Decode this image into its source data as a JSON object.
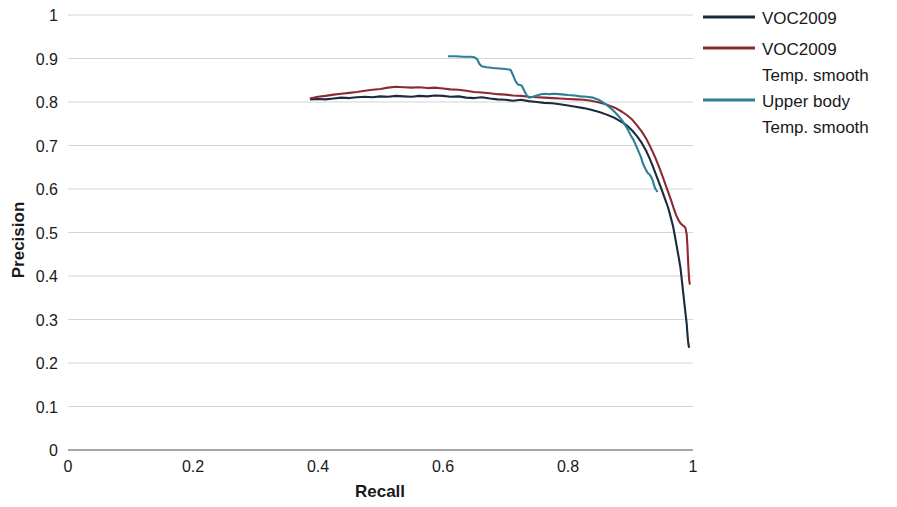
{
  "chart_data": {
    "type": "line",
    "title": "",
    "xlabel": "Recall",
    "ylabel": "Precision",
    "xlim": [
      0,
      1
    ],
    "ylim": [
      0,
      1
    ],
    "xticks": [
      "0",
      "0.2",
      "0.4",
      "0.6",
      "0.8",
      "1"
    ],
    "xtick_values": [
      0,
      0.2,
      0.4,
      0.6,
      0.8,
      1
    ],
    "yticks": [
      "0",
      "0.1",
      "0.2",
      "0.3",
      "0.4",
      "0.5",
      "0.6",
      "0.7",
      "0.8",
      "0.9",
      "1"
    ],
    "ytick_values": [
      0,
      0.1,
      0.2,
      0.3,
      0.4,
      0.5,
      0.6,
      0.7,
      0.8,
      0.9,
      1
    ],
    "grid": true,
    "legend_position": "right",
    "series": [
      {
        "name": "VOC2009",
        "color": "#1b2a3d",
        "points": [
          [
            0.387,
            0.806
          ],
          [
            0.4,
            0.807
          ],
          [
            0.412,
            0.806
          ],
          [
            0.425,
            0.808
          ],
          [
            0.437,
            0.81
          ],
          [
            0.45,
            0.809
          ],
          [
            0.462,
            0.811
          ],
          [
            0.475,
            0.812
          ],
          [
            0.487,
            0.811
          ],
          [
            0.5,
            0.813
          ],
          [
            0.512,
            0.812
          ],
          [
            0.525,
            0.814
          ],
          [
            0.537,
            0.813
          ],
          [
            0.55,
            0.812
          ],
          [
            0.562,
            0.814
          ],
          [
            0.575,
            0.813
          ],
          [
            0.587,
            0.815
          ],
          [
            0.6,
            0.814
          ],
          [
            0.612,
            0.812
          ],
          [
            0.625,
            0.813
          ],
          [
            0.637,
            0.81
          ],
          [
            0.65,
            0.809
          ],
          [
            0.662,
            0.811
          ],
          [
            0.675,
            0.808
          ],
          [
            0.687,
            0.806
          ],
          [
            0.7,
            0.805
          ],
          [
            0.712,
            0.803
          ],
          [
            0.725,
            0.805
          ],
          [
            0.737,
            0.802
          ],
          [
            0.75,
            0.8
          ],
          [
            0.762,
            0.798
          ],
          [
            0.775,
            0.797
          ],
          [
            0.787,
            0.795
          ],
          [
            0.8,
            0.792
          ],
          [
            0.812,
            0.789
          ],
          [
            0.825,
            0.786
          ],
          [
            0.837,
            0.782
          ],
          [
            0.85,
            0.777
          ],
          [
            0.862,
            0.771
          ],
          [
            0.875,
            0.763
          ],
          [
            0.887,
            0.753
          ],
          [
            0.895,
            0.745
          ],
          [
            0.903,
            0.734
          ],
          [
            0.91,
            0.722
          ],
          [
            0.918,
            0.706
          ],
          [
            0.925,
            0.688
          ],
          [
            0.93,
            0.672
          ],
          [
            0.935,
            0.655
          ],
          [
            0.94,
            0.636
          ],
          [
            0.945,
            0.617
          ],
          [
            0.95,
            0.598
          ],
          [
            0.955,
            0.578
          ],
          [
            0.96,
            0.558
          ],
          [
            0.964,
            0.537
          ],
          [
            0.968,
            0.515
          ],
          [
            0.971,
            0.492
          ],
          [
            0.974,
            0.468
          ],
          [
            0.977,
            0.444
          ],
          [
            0.98,
            0.418
          ],
          [
            0.982,
            0.392
          ],
          [
            0.984,
            0.366
          ],
          [
            0.986,
            0.34
          ],
          [
            0.988,
            0.314
          ],
          [
            0.99,
            0.289
          ],
          [
            0.991,
            0.268
          ],
          [
            0.992,
            0.252
          ],
          [
            0.993,
            0.24
          ],
          [
            0.994,
            0.235
          ]
        ]
      },
      {
        "name": "VOC2009 Temp. smooth",
        "color": "#8c2a33",
        "points": [
          [
            0.387,
            0.808
          ],
          [
            0.4,
            0.812
          ],
          [
            0.412,
            0.814
          ],
          [
            0.425,
            0.817
          ],
          [
            0.437,
            0.819
          ],
          [
            0.45,
            0.821
          ],
          [
            0.462,
            0.823
          ],
          [
            0.475,
            0.826
          ],
          [
            0.487,
            0.828
          ],
          [
            0.5,
            0.83
          ],
          [
            0.512,
            0.833
          ],
          [
            0.525,
            0.835
          ],
          [
            0.537,
            0.834
          ],
          [
            0.55,
            0.833
          ],
          [
            0.562,
            0.834
          ],
          [
            0.575,
            0.832
          ],
          [
            0.587,
            0.833
          ],
          [
            0.6,
            0.831
          ],
          [
            0.612,
            0.829
          ],
          [
            0.625,
            0.828
          ],
          [
            0.637,
            0.826
          ],
          [
            0.65,
            0.823
          ],
          [
            0.662,
            0.822
          ],
          [
            0.675,
            0.82
          ],
          [
            0.687,
            0.818
          ],
          [
            0.7,
            0.817
          ],
          [
            0.712,
            0.815
          ],
          [
            0.725,
            0.814
          ],
          [
            0.737,
            0.812
          ],
          [
            0.75,
            0.811
          ],
          [
            0.762,
            0.81
          ],
          [
            0.775,
            0.809
          ],
          [
            0.787,
            0.808
          ],
          [
            0.8,
            0.807
          ],
          [
            0.812,
            0.806
          ],
          [
            0.825,
            0.805
          ],
          [
            0.837,
            0.803
          ],
          [
            0.85,
            0.799
          ],
          [
            0.862,
            0.794
          ],
          [
            0.875,
            0.787
          ],
          [
            0.887,
            0.777
          ],
          [
            0.895,
            0.769
          ],
          [
            0.903,
            0.759
          ],
          [
            0.91,
            0.747
          ],
          [
            0.918,
            0.732
          ],
          [
            0.925,
            0.716
          ],
          [
            0.93,
            0.702
          ],
          [
            0.935,
            0.687
          ],
          [
            0.94,
            0.671
          ],
          [
            0.945,
            0.653
          ],
          [
            0.95,
            0.634
          ],
          [
            0.955,
            0.614
          ],
          [
            0.96,
            0.594
          ],
          [
            0.965,
            0.574
          ],
          [
            0.969,
            0.556
          ],
          [
            0.973,
            0.54
          ],
          [
            0.977,
            0.528
          ],
          [
            0.98,
            0.521
          ],
          [
            0.983,
            0.517
          ],
          [
            0.986,
            0.514
          ],
          [
            0.988,
            0.51
          ],
          [
            0.99,
            0.495
          ],
          [
            0.991,
            0.47
          ],
          [
            0.992,
            0.44
          ],
          [
            0.993,
            0.41
          ],
          [
            0.994,
            0.39
          ],
          [
            0.995,
            0.38
          ]
        ]
      },
      {
        "name": "Upper body Temp. smooth",
        "color": "#2b7f97",
        "points": [
          [
            0.608,
            0.905
          ],
          [
            0.62,
            0.905
          ],
          [
            0.632,
            0.904
          ],
          [
            0.644,
            0.904
          ],
          [
            0.65,
            0.903
          ],
          [
            0.655,
            0.898
          ],
          [
            0.658,
            0.888
          ],
          [
            0.662,
            0.882
          ],
          [
            0.67,
            0.88
          ],
          [
            0.68,
            0.878
          ],
          [
            0.69,
            0.877
          ],
          [
            0.7,
            0.876
          ],
          [
            0.708,
            0.874
          ],
          [
            0.712,
            0.862
          ],
          [
            0.716,
            0.848
          ],
          [
            0.72,
            0.84
          ],
          [
            0.726,
            0.838
          ],
          [
            0.73,
            0.826
          ],
          [
            0.734,
            0.815
          ],
          [
            0.738,
            0.81
          ],
          [
            0.744,
            0.812
          ],
          [
            0.75,
            0.815
          ],
          [
            0.757,
            0.818
          ],
          [
            0.764,
            0.819
          ],
          [
            0.77,
            0.818
          ],
          [
            0.778,
            0.819
          ],
          [
            0.786,
            0.818
          ],
          [
            0.794,
            0.817
          ],
          [
            0.8,
            0.816
          ],
          [
            0.81,
            0.815
          ],
          [
            0.82,
            0.813
          ],
          [
            0.83,
            0.812
          ],
          [
            0.84,
            0.81
          ],
          [
            0.848,
            0.806
          ],
          [
            0.855,
            0.8
          ],
          [
            0.862,
            0.793
          ],
          [
            0.868,
            0.786
          ],
          [
            0.874,
            0.778
          ],
          [
            0.88,
            0.769
          ],
          [
            0.886,
            0.759
          ],
          [
            0.891,
            0.748
          ],
          [
            0.896,
            0.736
          ],
          [
            0.9,
            0.724
          ],
          [
            0.905,
            0.712
          ],
          [
            0.909,
            0.699
          ],
          [
            0.913,
            0.686
          ],
          [
            0.917,
            0.672
          ],
          [
            0.92,
            0.658
          ],
          [
            0.924,
            0.646
          ],
          [
            0.927,
            0.638
          ],
          [
            0.93,
            0.634
          ],
          [
            0.933,
            0.628
          ],
          [
            0.936,
            0.618
          ],
          [
            0.938,
            0.607
          ],
          [
            0.94,
            0.6
          ],
          [
            0.942,
            0.596
          ],
          [
            0.943,
            0.593
          ]
        ]
      }
    ]
  },
  "legend": {
    "items": [
      {
        "label_line1": "VOC2009",
        "label_line2": "",
        "color": "#1b2a3d"
      },
      {
        "label_line1": "VOC2009",
        "label_line2": "Temp. smooth",
        "color": "#8c2a33"
      },
      {
        "label_line1": "Upper body",
        "label_line2": "Temp. smooth",
        "color": "#2b7f97"
      }
    ]
  },
  "axes": {
    "x_title": "Recall",
    "y_title": "Precision"
  }
}
